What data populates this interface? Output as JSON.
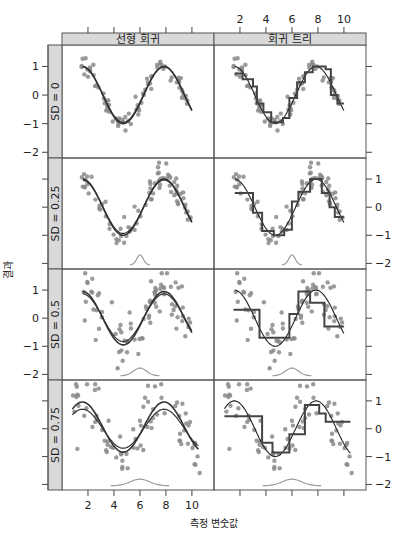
{
  "chart_data": {
    "type": "scatter",
    "layout": "trellis 2 columns x 4 rows",
    "xlabel": "측정 변숫값",
    "ylabel": "결과",
    "column_strips": [
      "선형 회귀",
      "회귀 트리"
    ],
    "row_strips": [
      "SD = 0",
      "SD = 0.25",
      "SD = 0.5",
      "SD = 0.75"
    ],
    "noise_sd": [
      0,
      0.25,
      0.5,
      0.75
    ],
    "x_ticks": [
      2,
      4,
      6,
      8,
      10
    ],
    "y_ticks": [
      1,
      0,
      -1,
      -2
    ],
    "xlim": [
      0,
      11.7
    ],
    "ylim": [
      -2.2,
      1.75
    ],
    "true_function": "y = sin(x)",
    "x_range_points": [
      1.5,
      10
    ],
    "n_points_per_panel": 80,
    "point_color": "#8a8a8a",
    "fit_line_color": "#333333",
    "density_curve_color": "#9a9a9a",
    "strip_fill": "#d9d9d9",
    "density_curve": {
      "center": 6,
      "sd": [
        0,
        0.25,
        0.5,
        0.75
      ],
      "shown_from_row": 1
    },
    "tree_step_fits": [
      [
        {
          "x0": 1.6,
          "x1": 2.2,
          "y": 0.75
        },
        {
          "x0": 2.2,
          "x1": 3.0,
          "y": 0.55
        },
        {
          "x0": 3.0,
          "x1": 3.3,
          "y": 0.3
        },
        {
          "x0": 3.3,
          "x1": 3.8,
          "y": -0.3
        },
        {
          "x0": 3.8,
          "x1": 4.4,
          "y": -0.6
        },
        {
          "x0": 4.4,
          "x1": 5.3,
          "y": -0.95
        },
        {
          "x0": 5.3,
          "x1": 5.8,
          "y": -0.8
        },
        {
          "x0": 5.8,
          "x1": 6.4,
          "y": -0.1
        },
        {
          "x0": 6.4,
          "x1": 7.0,
          "y": 0.45
        },
        {
          "x0": 7.0,
          "x1": 7.6,
          "y": 0.8
        },
        {
          "x0": 7.6,
          "x1": 8.6,
          "y": 1.0
        },
        {
          "x0": 8.6,
          "x1": 9.0,
          "y": 0.9
        },
        {
          "x0": 9.0,
          "x1": 9.5,
          "y": 0.0
        },
        {
          "x0": 9.5,
          "x1": 10.0,
          "y": -0.3
        }
      ],
      [
        {
          "x0": 1.6,
          "x1": 3.0,
          "y": 0.5
        },
        {
          "x0": 3.0,
          "x1": 3.7,
          "y": -0.2
        },
        {
          "x0": 3.7,
          "x1": 4.6,
          "y": -0.85
        },
        {
          "x0": 4.6,
          "x1": 5.4,
          "y": -1.0
        },
        {
          "x0": 5.4,
          "x1": 6.0,
          "y": -0.8
        },
        {
          "x0": 6.0,
          "x1": 6.5,
          "y": 0.2
        },
        {
          "x0": 6.5,
          "x1": 7.4,
          "y": 0.55
        },
        {
          "x0": 7.4,
          "x1": 8.3,
          "y": 1.0
        },
        {
          "x0": 8.3,
          "x1": 8.9,
          "y": 0.5
        },
        {
          "x0": 8.9,
          "x1": 9.3,
          "y": 0.0
        },
        {
          "x0": 9.3,
          "x1": 10.0,
          "y": -0.35
        }
      ],
      [
        {
          "x0": 1.5,
          "x1": 3.5,
          "y": 0.3
        },
        {
          "x0": 3.5,
          "x1": 5.8,
          "y": -0.7
        },
        {
          "x0": 5.8,
          "x1": 6.5,
          "y": 0.15
        },
        {
          "x0": 6.5,
          "x1": 7.4,
          "y": 0.95
        },
        {
          "x0": 7.4,
          "x1": 8.5,
          "y": 0.55
        },
        {
          "x0": 8.5,
          "x1": 9.5,
          "y": -0.3
        },
        {
          "x0": 9.5,
          "x1": 10.0,
          "y": -0.3
        }
      ],
      [
        {
          "x0": 0.8,
          "x1": 3.7,
          "y": 0.45
        },
        {
          "x0": 3.7,
          "x1": 4.5,
          "y": -0.5
        },
        {
          "x0": 4.5,
          "x1": 5.8,
          "y": -0.85
        },
        {
          "x0": 5.8,
          "x1": 7.0,
          "y": -0.2
        },
        {
          "x0": 7.0,
          "x1": 8.1,
          "y": 0.85
        },
        {
          "x0": 8.1,
          "x1": 8.6,
          "y": 0.55
        },
        {
          "x0": 8.6,
          "x1": 10.5,
          "y": 0.25
        }
      ]
    ]
  },
  "figure": {
    "x_axis_title": "측정 변숫값",
    "y_axis_title": "결과"
  }
}
